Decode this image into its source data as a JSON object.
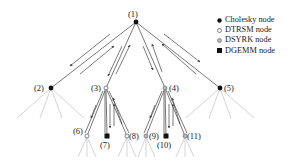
{
  "legend": {
    "items": [
      {
        "label": "Cholesky node",
        "symbol": "filled-circle",
        "color": "#111111"
      },
      {
        "label": "DTRSM node",
        "symbol": "open-circle",
        "color": "#555555"
      },
      {
        "label": "DSYRK node",
        "symbol": "gray-circle",
        "color": "#888888"
      },
      {
        "label": "DGEMM node",
        "symbol": "filled-square",
        "color": "#111111"
      }
    ]
  },
  "nodes": [
    {
      "id": "(1)",
      "type": "Cholesky"
    },
    {
      "id": "(2)",
      "type": "Cholesky"
    },
    {
      "id": "(3)",
      "type": "DTRSM"
    },
    {
      "id": "(4)",
      "type": "DSYRK"
    },
    {
      "id": "(5)",
      "type": "Cholesky"
    },
    {
      "id": "(6)",
      "type": "DTRSM"
    },
    {
      "id": "(7)",
      "type": "DGEMM"
    },
    {
      "id": "(8)",
      "type": "DTRSM"
    },
    {
      "id": "(9)",
      "type": "DSYRK"
    },
    {
      "id": "(10)",
      "type": "DGEMM"
    },
    {
      "id": "(11)",
      "type": "DSYRK"
    }
  ],
  "edges": [
    [
      "(1)",
      "(2)"
    ],
    [
      "(1)",
      "(3)"
    ],
    [
      "(1)",
      "(4)"
    ],
    [
      "(1)",
      "(5)"
    ],
    [
      "(3)",
      "(6)"
    ],
    [
      "(3)",
      "(7)"
    ],
    [
      "(3)",
      "(8)"
    ],
    [
      "(4)",
      "(9)"
    ],
    [
      "(4)",
      "(10)"
    ],
    [
      "(4)",
      "(11)"
    ]
  ]
}
